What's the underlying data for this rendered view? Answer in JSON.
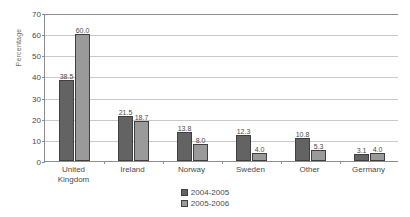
{
  "chart_data": {
    "type": "bar",
    "title": "",
    "xlabel": "",
    "ylabel": "Percentage",
    "ylim": [
      0,
      70
    ],
    "ytick_step": 10,
    "yticks": [
      "0",
      "10",
      "20",
      "30",
      "40",
      "50",
      "60",
      "70"
    ],
    "grid": true,
    "legend_position": "bottom-center",
    "categories": [
      "United\nKingdom",
      "Ireland",
      "Norway",
      "Sweden",
      "Other",
      "Germany"
    ],
    "series": [
      {
        "name": "2004-2005",
        "color": "#636363",
        "values": [
          38.5,
          21.5,
          13.8,
          12.3,
          10.8,
          3.1
        ],
        "labels": [
          "38.5",
          "21.5",
          "13.8",
          "12.3",
          "10.8",
          "3.1"
        ]
      },
      {
        "name": "2005-2006",
        "color": "#9a9a9a",
        "values": [
          60.0,
          18.7,
          8.0,
          4.0,
          5.3,
          4.0
        ],
        "labels": [
          "60.0",
          "18.7",
          "8.0",
          "4.0",
          "5.3",
          "4.0"
        ]
      }
    ]
  }
}
